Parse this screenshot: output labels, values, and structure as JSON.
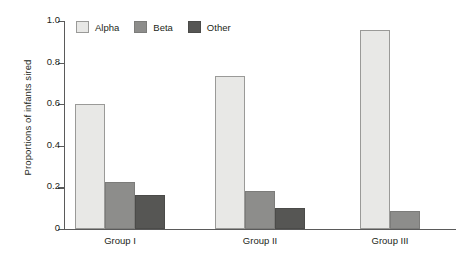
{
  "chart_data": {
    "type": "bar",
    "title": "",
    "subtitle": "",
    "xlabel": "",
    "ylabel": "Proportions of infants sired",
    "categories": [
      "Group I",
      "Group II",
      "Group III"
    ],
    "series": [
      {
        "name": "Alpha",
        "color": "#e8e8e6",
        "values": [
          0.6,
          0.735,
          0.955
        ]
      },
      {
        "name": "Beta",
        "color": "#8d8d8b",
        "values": [
          0.225,
          0.185,
          0.085
        ]
      },
      {
        "name": "Other",
        "color": "#565654",
        "values": [
          0.165,
          0.1,
          null
        ]
      }
    ],
    "ylim": [
      0,
      1.0
    ],
    "yticks": [
      0,
      0.2,
      0.4,
      0.6,
      0.8,
      1.0
    ],
    "ytick_labels": [
      "0",
      "0.2",
      "0.4",
      "0.6",
      "0.8",
      "1.0"
    ],
    "grid": false,
    "legend_position": "top-left",
    "legend_entries": [
      "Alpha",
      "Beta",
      "Other"
    ],
    "annotations": []
  },
  "axis": {
    "y_label": "Proportions of infants sired"
  }
}
